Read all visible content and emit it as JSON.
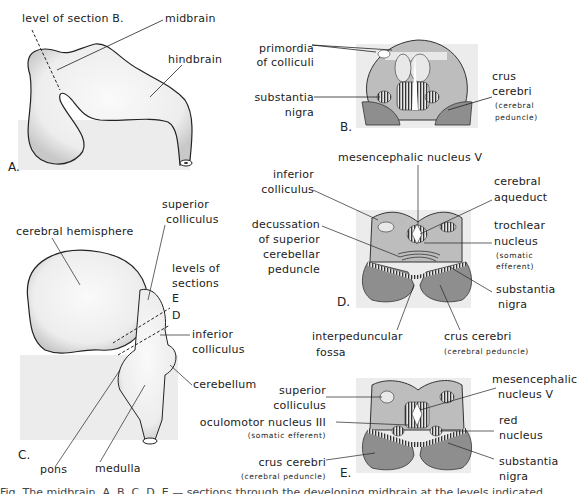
{
  "colors": {
    "section_fill": "#bdbdbd",
    "crus_fill": "#8e8e8e",
    "panel_bg": "#ececec",
    "brain_fill": "#f7f7f7",
    "line": "#333333"
  },
  "panel_a": {
    "letter": "A.",
    "labels": {
      "level_of_section": "level of section B.",
      "midbrain": "midbrain",
      "hindbrain": "hindbrain"
    }
  },
  "panel_b": {
    "letter": "B.",
    "labels": {
      "primordia_1": "primordia",
      "primordia_2": "of colliculi",
      "substantia_1": "substantia",
      "substantia_2": "nigra",
      "crus_1": "crus",
      "crus_2": "cerebri",
      "crus_3": "(cerebral",
      "crus_4": "peduncle)"
    }
  },
  "panel_c": {
    "letter": "C.",
    "labels": {
      "cerebral_hemisphere": "cerebral hemisphere",
      "superior_colliculus_1": "superior",
      "superior_colliculus_2": "colliculus",
      "levels_1": "levels of",
      "levels_2": "sections",
      "level_e": "E",
      "level_d": "D",
      "inferior_colliculus_1": "inferior",
      "inferior_colliculus_2": "colliculus",
      "cerebellum": "cerebellum",
      "pons": "pons",
      "medulla": "medulla"
    }
  },
  "panel_d": {
    "letter": "D.",
    "labels": {
      "mesencephalic": "mesencephalic nucleus V",
      "inferior_colliculus_1": "inferior",
      "inferior_colliculus_2": "colliculus",
      "cerebral_aqueduct_1": "cerebral",
      "cerebral_aqueduct_2": "aqueduct",
      "decussation_1": "decussation",
      "decussation_2": "of superior",
      "decussation_3": "cerebellar",
      "decussation_4": "peduncle",
      "trochlear_1": "trochlear",
      "trochlear_2": "nucleus",
      "trochlear_3": "(somatic",
      "trochlear_4": "efferent)",
      "substantia_1": "substantia",
      "substantia_2": "nigra",
      "interpeduncular_1": "interpeduncular",
      "interpeduncular_2": "fossa",
      "crus_1": "crus cerebri",
      "crus_2": "(cerebral peduncle)"
    }
  },
  "panel_e": {
    "letter": "E.",
    "labels": {
      "superior_colliculus_1": "superior",
      "superior_colliculus_2": "colliculus",
      "mesencephalic_1": "mesencephalic",
      "mesencephalic_2": "nucleus V",
      "oculomotor_1": "oculomotor nucleus III",
      "oculomotor_2": "(somatic efferent)",
      "red_1": "red",
      "red_2": "nucleus",
      "crus_1": "crus cerebri",
      "crus_2": "(cerebral peduncle)",
      "substantia_1": "substantia",
      "substantia_2": "nigra"
    }
  },
  "caption": {
    "text": "Fig. The midbrain. A, B, C, D, E — sections through the developing midbrain at the levels indicated."
  }
}
